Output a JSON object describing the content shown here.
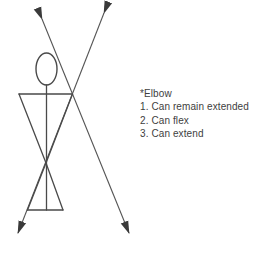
{
  "annotation": {
    "title": "*Elbow",
    "items": [
      "1. Can remain extended",
      "2. Can flex",
      "3. Can extend"
    ]
  },
  "colors": {
    "background": "#ffffff",
    "stroke": "#555555",
    "figure": "#4a4a4a",
    "arrowhead": "#3a3a3a",
    "text": "#3e3e3e"
  }
}
